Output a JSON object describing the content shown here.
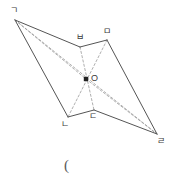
{
  "figure": {
    "caption": "(",
    "stroke_color": "#555555",
    "dash_color": "#9a9a9a",
    "label_color": "#3a3a3a",
    "background": "#ffffff",
    "vertices": [
      {
        "id": "g",
        "label": "ㄱ",
        "x": 15,
        "y": 20,
        "label_x": 10,
        "label_y": 6,
        "dot": false
      },
      {
        "id": "b",
        "label": "ㅂ",
        "x": 80,
        "y": 47,
        "label_x": 76,
        "label_y": 33,
        "dot": false
      },
      {
        "id": "m",
        "label": "ㅁ",
        "x": 107,
        "y": 40,
        "label_x": 103,
        "label_y": 27,
        "dot": false
      },
      {
        "id": "r",
        "label": "ㄹ",
        "x": 157,
        "y": 134,
        "label_x": 157,
        "label_y": 137,
        "dot": false
      },
      {
        "id": "d",
        "label": "ㄷ",
        "x": 94,
        "y": 110,
        "label_x": 89,
        "label_y": 112,
        "dot": false
      },
      {
        "id": "n",
        "label": "ㄴ",
        "x": 68,
        "y": 117,
        "label_x": 61,
        "label_y": 120,
        "dot": false
      },
      {
        "id": "o",
        "label": "O",
        "x": 86,
        "y": 79,
        "label_x": 91,
        "label_y": 74,
        "dot": true
      }
    ],
    "solid_edges": [
      {
        "name": "edge-g-b",
        "from": "g",
        "to": "b"
      },
      {
        "name": "edge-b-m",
        "from": "b",
        "to": "m"
      },
      {
        "name": "edge-m-r",
        "from": "m",
        "to": "r"
      },
      {
        "name": "edge-r-d",
        "from": "r",
        "to": "d"
      },
      {
        "name": "edge-d-n",
        "from": "d",
        "to": "n"
      },
      {
        "name": "edge-n-g",
        "from": "n",
        "to": "g"
      }
    ],
    "dashed_edges": [
      {
        "name": "diagonal-g-r",
        "from": "g",
        "to": "r"
      },
      {
        "name": "diagonal-b-d",
        "from": "b",
        "to": "d"
      },
      {
        "name": "diagonal-m-n",
        "from": "m",
        "to": "n"
      },
      {
        "name": "segment-g-o",
        "from": "g",
        "to": "o"
      },
      {
        "name": "segment-o-r",
        "from": "o",
        "to": "r"
      }
    ]
  }
}
